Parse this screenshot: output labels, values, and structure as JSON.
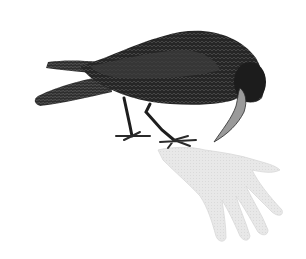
{
  "illustration": {
    "subject": "crow pecking at a glove",
    "colors": {
      "background": "#ffffff",
      "bird_dark": "#1e1e1e",
      "bird_mid": "#3a3a3a",
      "bird_light": "#6a6a6a",
      "beak": "#9a9a9a",
      "glove": "#e6e6e6",
      "glove_shadow": "#d2d2d2"
    }
  }
}
